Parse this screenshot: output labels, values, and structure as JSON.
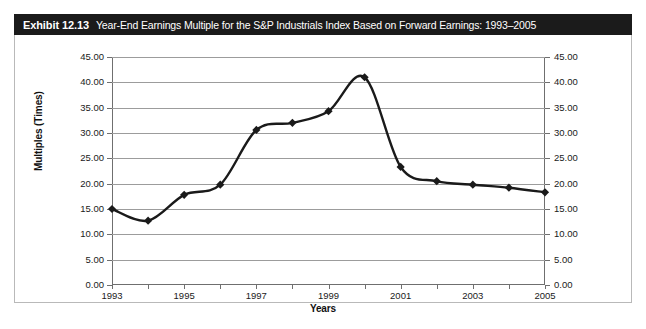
{
  "exhibit": {
    "number": "Exhibit 12.13",
    "caption": "Year-End Earnings Multiple for the S&P Industrials Index Based on Forward Earnings: 1993–2005"
  },
  "axes": {
    "y_title": "Multiples (Times)",
    "x_title": "Years",
    "y_ticks_left": [
      "45.00",
      "40.00",
      "35.00",
      "30.00",
      "25.00",
      "20.00",
      "15.00",
      "10.00",
      "5.00",
      "0.00"
    ],
    "y_ticks_right": [
      "45.00",
      "40.00",
      "35.00",
      "30.00",
      "25.00",
      "20.00",
      "15.00",
      "10.00",
      "5.00",
      "0.00"
    ],
    "x_ticks": [
      "1993",
      "",
      "1995",
      "",
      "1997",
      "",
      "1999",
      "",
      "2001",
      "",
      "2003",
      "",
      "2005"
    ]
  },
  "chart_data": {
    "type": "line",
    "title": "Year-End Earnings Multiple for the S&P Industrials Index Based on Forward Earnings: 1993–2005",
    "xlabel": "Years",
    "ylabel": "Multiples (Times)",
    "categories": [
      1993,
      1994,
      1995,
      1996,
      1997,
      1998,
      1999,
      2000,
      2001,
      2002,
      2003,
      2004,
      2005
    ],
    "values": [
      15.0,
      12.7,
      17.8,
      19.8,
      30.6,
      32.0,
      34.3,
      41.0,
      23.3,
      20.5,
      19.8,
      19.2,
      18.3
    ],
    "xlim": [
      1993,
      2005
    ],
    "ylim": [
      0,
      45
    ],
    "ytick_step": 5,
    "grid": "horizontal",
    "legend": "none",
    "marker": "diamond",
    "line_color": "#1a1a1a",
    "marker_color": "#1a1a1a"
  }
}
